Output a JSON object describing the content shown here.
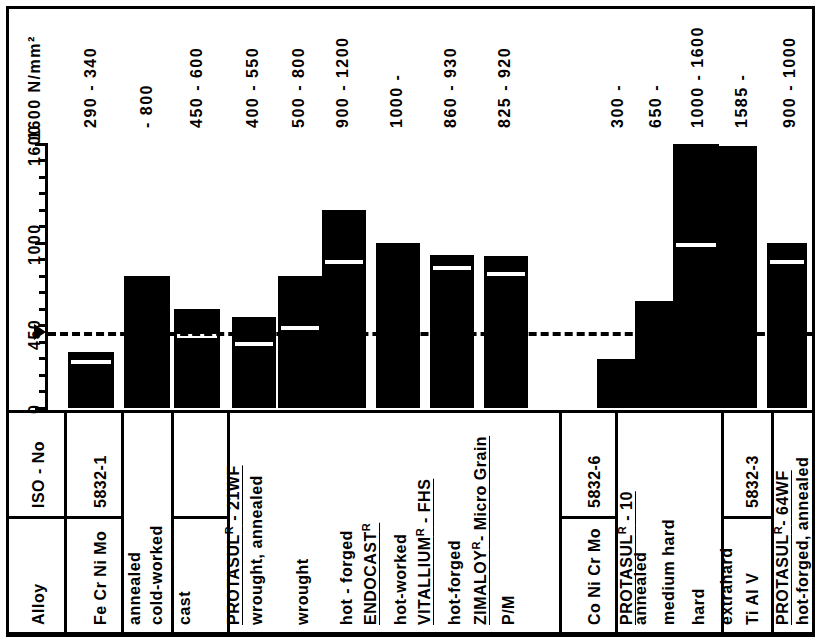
{
  "figure": {
    "unit_label": "1600  N/mm²",
    "y_axis": {
      "ticks_labeled": [
        "0",
        "450",
        "1000",
        "1600"
      ],
      "min": 0,
      "max": 1600,
      "reference_line_value": 450
    }
  },
  "table": {
    "row_headers": [
      "Alloy",
      "ISO - No"
    ]
  },
  "top_labels": [
    "290 - 340",
    "- 800",
    "450 - 600",
    "400 - 550",
    "500 - 800",
    "900 - 1200",
    "1000 -",
    "860 - 930",
    "825 - 920",
    "300 -",
    "650 -",
    "1000 - 1600",
    "1585 -",
    "900 - 1000"
  ],
  "groups": [
    {
      "alloy": "Fe Cr Ni Mo",
      "iso": "5832-1",
      "brand": null,
      "conditions": [
        "annealed",
        "cold-worked"
      ]
    },
    {
      "alloy": "Co Cr Mo",
      "iso": "5832-4",
      "brand": null,
      "conditions": [
        "cast"
      ]
    },
    {
      "alloy": null,
      "iso": null,
      "brand": "PROTASUL",
      "brand_sup": "R",
      "brand_suffix": " - 21WF",
      "conditions": [
        "wrought, annealed",
        "wrought",
        "hot - forged"
      ]
    },
    {
      "alloy": null,
      "iso": null,
      "brand": "ENDOCAST",
      "brand_sup": "R",
      "brand_suffix": "",
      "conditions": [
        "hot-worked"
      ]
    },
    {
      "alloy": null,
      "iso": null,
      "brand": "VITALLIUM",
      "brand_sup": "R",
      "brand_suffix": " - FHS",
      "conditions": [
        "hot-forged"
      ]
    },
    {
      "alloy": null,
      "iso": null,
      "brand": "ZIMALOY",
      "brand_sup": "R",
      "brand_suffix": "- Micro Grain",
      "conditions": [
        "P/M"
      ]
    },
    {
      "alloy": "Co Ni Cr Mo",
      "iso": "5832-6",
      "brand": null,
      "conditions": []
    },
    {
      "alloy": null,
      "iso": null,
      "brand": "PROTASUL",
      "brand_sup": "R",
      "brand_suffix": " - 10",
      "conditions": [
        "annealed",
        "medium hard",
        "hard",
        "extrahard"
      ]
    },
    {
      "alloy": "Ti Al V",
      "iso": "5832-3",
      "brand": null,
      "conditions": []
    },
    {
      "alloy": null,
      "iso": null,
      "brand": "PROTASUL",
      "brand_sup": "R",
      "brand_suffix": "- 64WF",
      "conditions": [
        "hot-forged, annealed"
      ]
    }
  ],
  "chart_data": {
    "type": "bar",
    "title": "",
    "ylabel": "N/mm²",
    "xlabel": "",
    "ylim": [
      0,
      1600
    ],
    "grid": false,
    "legend": "none",
    "reference_line": 450,
    "categories": [
      "Fe Cr Ni Mo 5832-1 / annealed",
      "Fe Cr Ni Mo 5832-1 / cold-worked",
      "Co Cr Mo 5832-4 / cast",
      "PROTASUL R - 21WF / wrought, annealed",
      "PROTASUL R - 21WF / wrought",
      "PROTASUL R - 21WF / hot - forged",
      "ENDOCAST R / hot-worked",
      "VITALLIUM R - FHS / hot-forged",
      "ZIMALOY R - Micro Grain / P/M",
      "PROTASUL R - 10 / annealed",
      "PROTASUL R - 10 / medium hard",
      "PROTASUL R - 10 / hard",
      "PROTASUL R - 10 / extrahard",
      "PROTASUL R - 64WF / hot-forged, annealed"
    ],
    "series": [
      {
        "name": "lower bound (N/mm²)",
        "values": [
          290,
          null,
          450,
          400,
          500,
          900,
          null,
          860,
          825,
          null,
          null,
          1000,
          null,
          900
        ]
      },
      {
        "name": "upper bound (N/mm²)",
        "values": [
          340,
          800,
          600,
          550,
          800,
          1200,
          1000,
          930,
          920,
          300,
          650,
          1600,
          1585,
          1000
        ]
      }
    ],
    "range_labels": [
      "290 - 340",
      "- 800",
      "450 - 600",
      "400 - 550",
      "500 - 800",
      "900 - 1200",
      "1000 -",
      "860 - 930",
      "825 - 920",
      "300 -",
      "650 -",
      "1000 - 1600",
      "1585 -",
      "900 - 1000"
    ]
  }
}
